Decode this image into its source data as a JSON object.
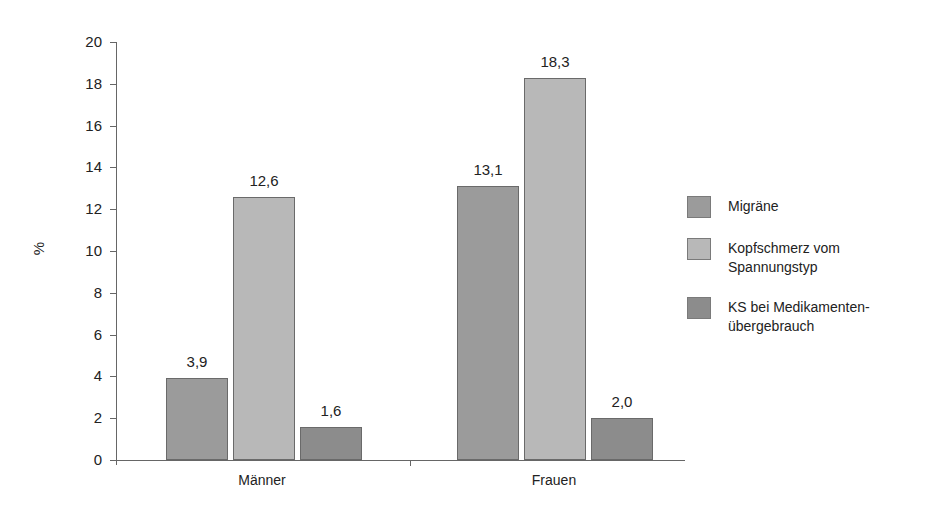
{
  "chart_data": {
    "type": "bar",
    "title": "",
    "xlabel": "",
    "ylabel": "%",
    "ylim": [
      0,
      20
    ],
    "yticks": [
      0,
      2,
      4,
      6,
      8,
      10,
      12,
      14,
      16,
      18,
      20
    ],
    "grid": false,
    "legend_position": "right",
    "categories": [
      "Männer",
      "Frauen"
    ],
    "series": [
      {
        "name": "Migräne",
        "values": [
          3.9,
          13.1
        ],
        "labels": [
          "3,9",
          "13,1"
        ],
        "color": "#9b9b9b"
      },
      {
        "name": "Kopfschmerz vom Spannungstyp",
        "values": [
          12.6,
          18.3
        ],
        "labels": [
          "12,6",
          "18,3"
        ],
        "color": "#b8b8b8"
      },
      {
        "name": "KS bei Medikamentenübergebrauch",
        "values": [
          1.6,
          2.0
        ],
        "labels": [
          "1,6",
          "2,0"
        ],
        "color": "#8c8c8c"
      }
    ]
  },
  "axis": {
    "ylabel": "%",
    "yticks": [
      "0",
      "2",
      "4",
      "6",
      "8",
      "10",
      "12",
      "14",
      "16",
      "18",
      "20"
    ],
    "categories": [
      "Männer",
      "Frauen"
    ]
  },
  "legend": [
    {
      "label": "Migräne",
      "color": "#9b9b9b"
    },
    {
      "label": "Kopfschmerz vom\nSpannungstyp",
      "color": "#b8b8b8"
    },
    {
      "label": "KS bei Medikamenten-\nübergebrauch",
      "color": "#8c8c8c"
    }
  ]
}
